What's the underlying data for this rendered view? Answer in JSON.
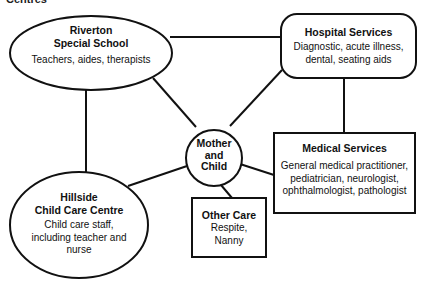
{
  "header": {
    "cut_off_text": "Centres"
  },
  "center_node": {
    "title_lines": [
      "Mother",
      "and",
      "Child"
    ]
  },
  "nodes": {
    "riverton": {
      "title_lines": [
        "Riverton",
        "Special School"
      ],
      "desc_lines": [
        "Teachers, aides, therapists"
      ]
    },
    "hospital": {
      "title_lines": [
        "Hospital Services"
      ],
      "desc_lines": [
        "Diagnostic, acute illness,",
        "dental, seating aids"
      ]
    },
    "medical": {
      "title_lines": [
        "Medical Services"
      ],
      "desc_lines": [
        "General medical practitioner,",
        "pediatrician, neurologist,",
        "ophthalmologist, pathologist"
      ]
    },
    "hillside": {
      "title_lines": [
        "Hillside",
        "Child Care Centre"
      ],
      "desc_lines": [
        "Child care staff,",
        "including teacher and",
        "nurse"
      ]
    },
    "other": {
      "title_lines": [
        "Other Care"
      ],
      "desc_lines": [
        "Respite,",
        "Nanny"
      ]
    }
  },
  "edges": [
    {
      "from": "riverton",
      "to": "hospital"
    },
    {
      "from": "riverton",
      "to": "center"
    },
    {
      "from": "riverton",
      "to": "hillside"
    },
    {
      "from": "hospital",
      "to": "center"
    },
    {
      "from": "hospital",
      "to": "medical"
    },
    {
      "from": "center",
      "to": "medical"
    },
    {
      "from": "center",
      "to": "hillside"
    },
    {
      "from": "center",
      "to": "other"
    }
  ],
  "colors": {
    "stroke": "#111111",
    "background": "#ffffff"
  }
}
